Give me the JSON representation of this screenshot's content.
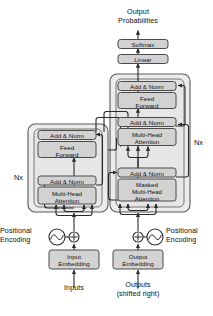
{
  "figure": {
    "type": "diagram"
  },
  "colors": {
    "box_fill": "#d2d2d2",
    "box_stroke": "#4a4a4a",
    "container_fill": "#ececec",
    "container_stroke": "#5a5a5a",
    "line": "#2b2b2b",
    "text": "#111111",
    "background": "#ffffff"
  },
  "labels": {
    "output_probabilities_line1": "Output",
    "output_probabilities_line2": "Probabilities",
    "inputs": "Inputs",
    "outputs_line1": "Outputs",
    "outputs_line2": "(shifted right)",
    "positional_encoding_left_line1": "Positional",
    "positional_encoding_left_line2": "Encoding",
    "positional_encoding_right_line1": "Positional",
    "positional_encoding_right_line2": "Encoding",
    "nx_encoder": "Nx",
    "nx_decoder": "Nx"
  },
  "blocks": {
    "softmax": "Softmax",
    "linear": "Linear",
    "decoder_add_norm_top": "Add & Norm",
    "decoder_feed_forward_line1": "Feed",
    "decoder_feed_forward_line2": "Forward",
    "decoder_add_norm_mid": "Add & Norm",
    "decoder_cross_attention_line1": "Multi-Head",
    "decoder_cross_attention_line2": "Attention",
    "decoder_add_norm_bottom": "Add & Norm",
    "decoder_masked_attention_line1": "Masked",
    "decoder_masked_attention_line2": "Multi-Head",
    "decoder_masked_attention_line3": "Attention",
    "encoder_add_norm_top": "Add & Norm",
    "encoder_feed_forward_line1": "Feed",
    "encoder_feed_forward_line2": "Forward",
    "encoder_add_norm_bottom": "Add & Norm",
    "encoder_self_attention_line1": "Multi-Head",
    "encoder_self_attention_line2": "Attention",
    "input_embedding_line1": "Input",
    "input_embedding_line2": "Embedding",
    "output_embedding_line1": "Output",
    "output_embedding_line2": "Embedding"
  },
  "icons": {
    "sum_left": "⊕",
    "sum_right": "⊕",
    "sine_left": "sine-wave-icon",
    "sine_right": "sine-wave-icon"
  }
}
